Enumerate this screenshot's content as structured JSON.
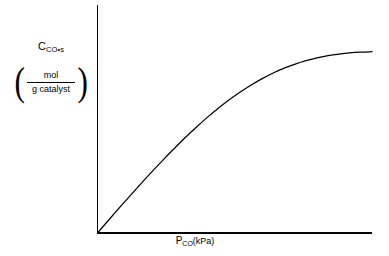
{
  "figure": {
    "background_color": "#ffffff",
    "line_color": "#000000",
    "y_axis": {
      "symbol": "C",
      "subscript": "CO•s",
      "units_numerator": "mol",
      "units_denominator": "g catalyst",
      "paren_left": "(",
      "paren_right": ")"
    },
    "x_axis": {
      "symbol": "P",
      "subscript": "CO",
      "units": "(kPa)"
    }
  },
  "chart_data": {
    "type": "line",
    "title": "",
    "subtitle": "",
    "xlabel": "P_CO (kPa)",
    "ylabel": "C_CO•s (mol / g catalyst)",
    "grid": false,
    "legend": null,
    "tick_labels_x": [],
    "tick_labels_y": [],
    "axis_style": "bare-lines-no-ticks",
    "xlim": [
      0,
      1
    ],
    "ylim": [
      0,
      1
    ],
    "series": [
      {
        "name": "adsorbed CO concentration",
        "model": "langmuir",
        "plateau_fraction": 0.795,
        "x": [
          0.0,
          0.04,
          0.08,
          0.12,
          0.16,
          0.2,
          0.24,
          0.28,
          0.32,
          0.36,
          0.4,
          0.44,
          0.48,
          0.52,
          0.56,
          0.6,
          0.64,
          0.68,
          0.72,
          0.76,
          0.8,
          0.84,
          0.88,
          0.92,
          0.96,
          1.0
        ],
        "y": [
          0.0,
          0.056,
          0.111,
          0.165,
          0.219,
          0.271,
          0.322,
          0.371,
          0.419,
          0.464,
          0.507,
          0.547,
          0.584,
          0.618,
          0.649,
          0.677,
          0.702,
          0.723,
          0.741,
          0.756,
          0.768,
          0.778,
          0.785,
          0.79,
          0.793,
          0.795
        ]
      }
    ]
  }
}
